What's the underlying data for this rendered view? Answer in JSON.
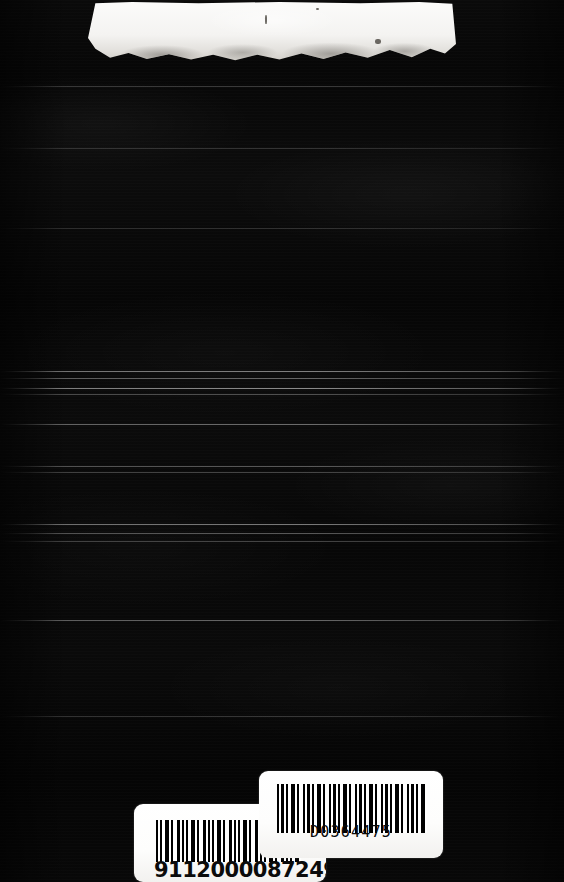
{
  "scan": {
    "medium": "book-cover",
    "surface_color": "#060606",
    "label_color": "#ffffff",
    "ink_color": "#000000"
  },
  "top_label": {
    "name": "torn-label-residue",
    "text": "",
    "description": ""
  },
  "barcodes": {
    "upper": {
      "value": "D0364475",
      "symbology_style": "bars"
    },
    "lower": {
      "value": "9112000087249",
      "symbology_style": "bars"
    }
  }
}
